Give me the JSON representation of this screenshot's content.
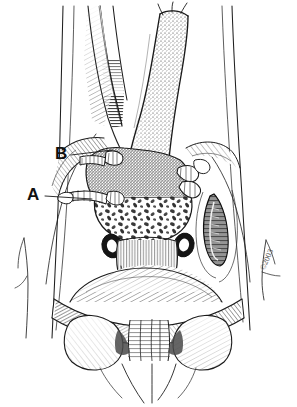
{
  "figure": {
    "kind": "medical-line-illustration",
    "technique": "pen-and-ink stipple and cross-hatch",
    "background_color": "#ffffff",
    "ink_color": "#1a1a1a",
    "width": 297,
    "height": 407,
    "signature": "©2003"
  },
  "annotations": [
    {
      "id": "a",
      "label": "A",
      "x": 27,
      "y": 186,
      "leader_from_x": 45,
      "leader_from_y": 196,
      "leader_to_x": 92,
      "leader_to_y": 199
    },
    {
      "id": "b",
      "label": "B",
      "x": 55,
      "y": 145,
      "leader_from_x": 71,
      "leader_from_y": 155,
      "leader_to_x": 112,
      "leader_to_y": 150
    }
  ],
  "regions": {
    "upper_left_vessel": "slender tapering tubular structure running from top edge downward, finely hatched along its lower taper",
    "upper_right_duct": "broad stippled tubular structure descending from top edge with fine thread-like sutures at its apex",
    "central_mass": "rounded stippled and mottled body occupying the mid-field, densely speckled above and coarsely mottled below",
    "anastomosis": "transverse suture line with regularly spaced stitches below the central mass",
    "lateral_rings": "two small dark ring-shaped cross-sections flanking the anastomosis",
    "right_lens_structure": "dark elongated lens-shaped cross-section on the right with internal hatching",
    "lower_band": "broad transverse hatched band spanning the lower field",
    "lower_lobes": "paired rounded lobes below the band with hatched shading",
    "lower_arches": "pair of thin descending arches at the bottom center",
    "side_branch_left": "thin forked twig-like line at the left margin",
    "side_branch_right": "thin forked twig-like line at the right margin near the signature"
  }
}
